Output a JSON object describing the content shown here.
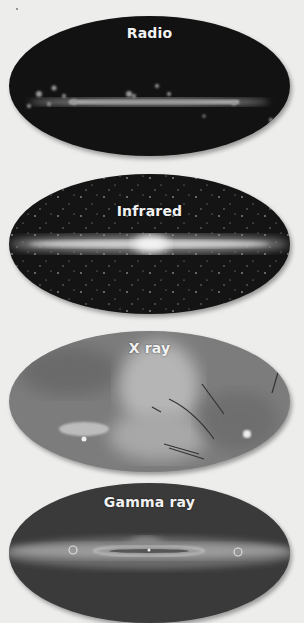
{
  "figure": {
    "panels": [
      {
        "label": "Radio",
        "base_color": "#141414",
        "band_color": "#d8d8d8"
      },
      {
        "label": "Infrared",
        "base_color": "#151515",
        "band_color": "#e6e6e6"
      },
      {
        "label": "X ray",
        "base_color": "#7a7a7a",
        "band_color": "#c8c8c8"
      },
      {
        "label": "Gamma ray",
        "base_color": "#3c3c3c",
        "band_color": "#9a9a9a"
      }
    ]
  }
}
